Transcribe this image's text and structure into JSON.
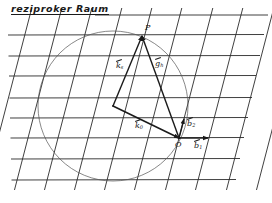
{
  "title": "reziproker Raum",
  "colors": {
    "ink": "#1a1a1a",
    "circle": "#555555",
    "background": "#ffffff"
  },
  "grid": {
    "horizontal_lines_y": [
      35,
      56,
      76,
      98,
      118,
      138,
      159,
      180
    ],
    "top_line": {
      "y": 15,
      "x_start": 95
    },
    "slanted_lines_x_at_y138": [
      -2,
      28,
      58,
      88,
      118,
      148,
      179,
      209,
      240,
      270
    ],
    "slant_dx_per_dy": 0.26
  },
  "circle": {
    "cx": 113,
    "cy": 106,
    "r": 75
  },
  "points": {
    "M": {
      "x": 113,
      "y": 106
    },
    "P": {
      "x": 142,
      "y": 36,
      "label": "P"
    },
    "O": {
      "x": 179,
      "y": 138,
      "label": "O"
    }
  },
  "vectors": [
    {
      "name": "k0",
      "from": "M",
      "to": "O",
      "label": "k",
      "sub": "0"
    },
    {
      "name": "ks",
      "from": "M",
      "to": "P",
      "label": "k",
      "sub": "s"
    },
    {
      "name": "gh",
      "from": "O",
      "to": "P",
      "label": "g",
      "sub": "h"
    },
    {
      "name": "b2",
      "from": "O",
      "to_xy": [
        184,
        119
      ],
      "label": "b",
      "sub": "2"
    },
    {
      "name": "b1",
      "from": "O",
      "to_xy": [
        208,
        138
      ],
      "label": "b",
      "sub": "1"
    }
  ],
  "labels": {
    "P": "P",
    "O": "O",
    "ks": "k",
    "ks_sub": "s",
    "gh": "g",
    "gh_sub": "h",
    "k0": "k",
    "k0_sub": "0",
    "b2": "b",
    "b2_sub": "2",
    "b1": "b",
    "b1_sub": "1"
  }
}
